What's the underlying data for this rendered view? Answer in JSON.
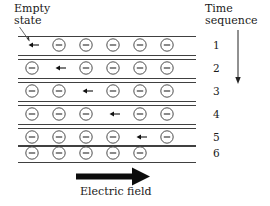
{
  "figure": {
    "background_color": "#ffffff",
    "line_color": "#2b2b2b",
    "arrow_color": "#0c0c0c"
  },
  "annotations": {
    "empty_state": {
      "line1": "Empty",
      "line2": "state",
      "pointer_icon": "diagonal-pointer-arrow",
      "points_to_row": 1,
      "points_to_slot": 1
    },
    "time_sequence": {
      "line1": "Time",
      "line2": "sequence",
      "arrow_icon": "down-arrow",
      "direction": "down"
    },
    "electric_field": {
      "label": "Electric field",
      "arrow_icon": "thick-right-arrow",
      "direction": "right"
    }
  },
  "legend": {
    "electron_symbol": "−",
    "electron_name": "electron",
    "empty_slot_name": "empty state"
  },
  "chart_data": {
    "type": "diagram",
    "slots_per_row": 6,
    "row_count": 6,
    "rows": [
      {
        "number": "1",
        "empty_slot": 1,
        "electron_slots": [
          2,
          3,
          4,
          5,
          6
        ],
        "drift_arrow_slot": 1,
        "has_drift_arrow": true
      },
      {
        "number": "2",
        "empty_slot": 2,
        "electron_slots": [
          1,
          3,
          4,
          5,
          6
        ],
        "drift_arrow_slot": 2,
        "has_drift_arrow": true
      },
      {
        "number": "3",
        "empty_slot": 3,
        "electron_slots": [
          1,
          2,
          4,
          5,
          6
        ],
        "drift_arrow_slot": 3,
        "has_drift_arrow": true
      },
      {
        "number": "4",
        "empty_slot": 4,
        "electron_slots": [
          1,
          2,
          3,
          5,
          6
        ],
        "drift_arrow_slot": 4,
        "has_drift_arrow": true
      },
      {
        "number": "5",
        "empty_slot": 5,
        "electron_slots": [
          1,
          2,
          3,
          4,
          6
        ],
        "drift_arrow_slot": 5,
        "has_drift_arrow": true
      },
      {
        "number": "6",
        "empty_slot": 6,
        "electron_slots": [
          1,
          2,
          3,
          4,
          5
        ],
        "drift_arrow_slot": 0,
        "has_drift_arrow": false
      }
    ],
    "row_numbers": [
      "1",
      "2",
      "3",
      "4",
      "5",
      "6"
    ],
    "electron_drift_direction": "left",
    "hole_drift_direction": "right",
    "field_direction": "right",
    "time_direction": "down"
  },
  "geometry": {
    "slot_x": [
      32,
      59,
      86,
      113,
      140,
      167
    ],
    "row_center_y": [
      45,
      68,
      91,
      114,
      137,
      153
    ],
    "row_top_y": [
      36,
      59,
      82,
      105,
      128,
      145
    ],
    "row_bottom_y": [
      55,
      78,
      101,
      124,
      146,
      162
    ],
    "row_number_x": 213,
    "electron_radius": 6.2,
    "left_edge_x": 18,
    "right_edge_x": 196
  }
}
